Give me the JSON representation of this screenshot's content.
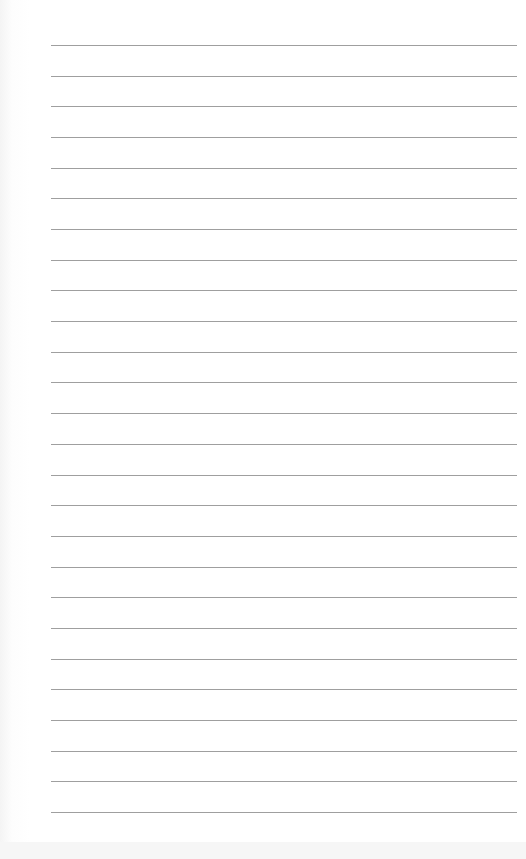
{
  "document": {
    "type": "lined-paper",
    "line_count": 26,
    "first_line_y": 45,
    "line_spacing": 30.68,
    "line_left": 51,
    "line_width": 466,
    "line_color": "#8e8e8e",
    "paper_color": "#ffffff"
  }
}
